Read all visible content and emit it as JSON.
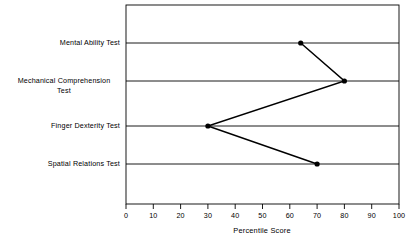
{
  "chart_data": {
    "type": "line",
    "title": "",
    "subtitle": "",
    "xlabel": "Percentile Score",
    "ylabel": "",
    "xlim": [
      0,
      100
    ],
    "xticks": [
      "0",
      "10",
      "20",
      "30",
      "40",
      "50",
      "60",
      "70",
      "80",
      "90",
      "100"
    ],
    "xtick_values": [
      0,
      10,
      20,
      30,
      40,
      50,
      60,
      70,
      80,
      90,
      100
    ],
    "grid": "horizontal",
    "legend": "none",
    "orientation": "horizontal-categories",
    "categories": [
      "Mental Ability Test",
      "Mechanical Comprehension Test",
      "Finger Dexterity Test",
      "Spatial Relations Test"
    ],
    "category_label_lines": [
      [
        "Mental Ability Test"
      ],
      [
        "Mechanical Comprehension",
        "Test"
      ],
      [
        "Finger Dexterity Test"
      ],
      [
        "Spatial Relations Test"
      ]
    ],
    "values": [
      64,
      80,
      30,
      70
    ],
    "series": [
      {
        "name": "Percentile Score",
        "values": [
          64,
          80,
          30,
          70
        ],
        "marker": "filled-circle",
        "color": "#000000"
      }
    ],
    "points": [
      {
        "category": "Mental Ability Test",
        "value": 64
      },
      {
        "category": "Mechanical Comprehension Test",
        "value": 80
      },
      {
        "category": "Finger Dexterity Test",
        "value": 30
      },
      {
        "category": "Spatial Relations Test",
        "value": 70
      }
    ],
    "colors": {
      "line": "#000000",
      "marker": "#000000",
      "grid": "#000000",
      "axis": "#000000",
      "background": "#ffffff"
    }
  },
  "layout": {
    "plot_left": 126,
    "plot_right": 399,
    "plot_top": 5,
    "plot_bottom": 204,
    "row_y": [
      43,
      81,
      126,
      164
    ]
  }
}
